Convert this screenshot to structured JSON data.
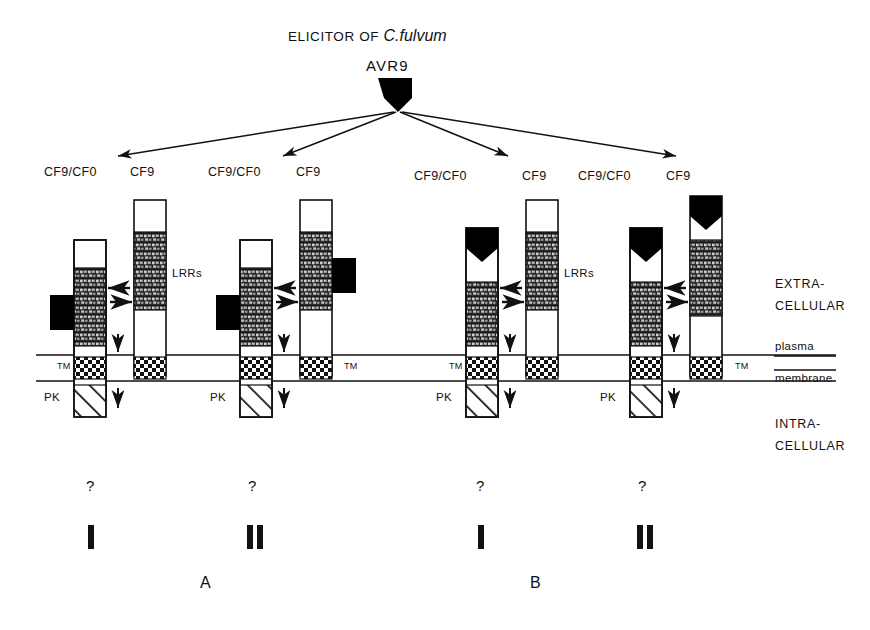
{
  "figure": {
    "title_prefix": "ELICITOR OF",
    "title_species": "C.fulvum",
    "elicitor_label": "AVR9"
  },
  "side_labels": {
    "extra_line1": "EXTRA-",
    "extra_line2": "CELLULAR",
    "plasma": "plasma",
    "membrane": "membrane",
    "intra_line1": "INTRA-",
    "intra_line2": "CELLULAR"
  },
  "domain_labels": {
    "lrrs": "LRRs",
    "tm": "TM",
    "pk": "PK"
  },
  "groups": [
    {
      "id": "A",
      "group_label": "A",
      "models": [
        {
          "roman": "I",
          "question": "?",
          "left_label": "CF9/CF0",
          "right_label": "CF9",
          "left_elicitor_position": "side",
          "right_elicitor_position": "none"
        },
        {
          "roman": "II",
          "question": "?",
          "left_label": "CF9/CF0",
          "right_label": "CF9",
          "left_elicitor_position": "side",
          "right_elicitor_position": "side"
        }
      ]
    },
    {
      "id": "B",
      "group_label": "B",
      "models": [
        {
          "roman": "I",
          "question": "?",
          "left_label": "CF9/CF0",
          "right_label": "CF9",
          "left_elicitor_position": "top",
          "right_elicitor_position": "none"
        },
        {
          "roman": "II",
          "question": "?",
          "left_label": "CF9/CF0",
          "right_label": "CF9",
          "left_elicitor_position": "top",
          "right_elicitor_position": "top"
        }
      ]
    },
    {
      "id": "lrrs_second",
      "lrrs_label": "LRRs"
    }
  ],
  "colors": {
    "ink": "#111111",
    "elicitor_fill": "#000000",
    "lrr_fill": "#303030",
    "background": "#ffffff"
  }
}
